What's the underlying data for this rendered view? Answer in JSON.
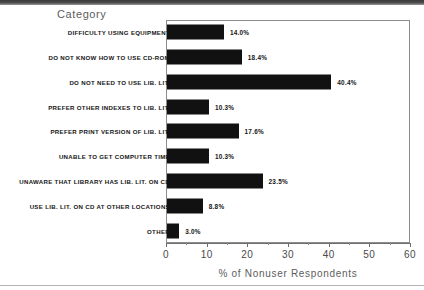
{
  "figure": {
    "category_heading": "Category",
    "x_axis_title": "% of Nonuser Respondents"
  },
  "chart_data": {
    "type": "bar",
    "orientation": "horizontal",
    "title": "",
    "xlabel": "% of Nonuser Respondents",
    "ylabel": "Category",
    "xlim": [
      0,
      60
    ],
    "xticks": [
      0,
      10,
      20,
      30,
      40,
      50,
      60
    ],
    "xtick_labels": [
      "0",
      "10",
      "20",
      "30",
      "40",
      "50",
      "60"
    ],
    "minor_tick_interval": 5,
    "grid": false,
    "legend": null,
    "bar_color": "#111111",
    "value_label_suffix": "%",
    "categories": [
      "DIFFICULTY USING EQUIPMENT",
      "DO NOT KNOW HOW TO USE CD-ROM",
      "DO NOT NEED TO USE LIB. LIT.",
      "PREFER OTHER INDEXES TO LIB. LIT.",
      "PREFER PRINT VERSION OF LIB. LIT.",
      "UNABLE TO GET COMPUTER TIME",
      "UNAWARE THAT LIBRARY HAS LIB. LIT. ON CD",
      "USE LIB. LIT. ON CD AT OTHER LOCATIONS",
      "OTHER"
    ],
    "values": [
      14.0,
      18.4,
      40.4,
      10.3,
      17.6,
      10.3,
      23.5,
      8.8,
      3.0
    ],
    "value_labels": [
      "14.0%",
      "18.4%",
      "40.4%",
      "10.3%",
      "17.6%",
      "10.3%",
      "23.5%",
      "8.8%",
      "3.0%"
    ]
  }
}
